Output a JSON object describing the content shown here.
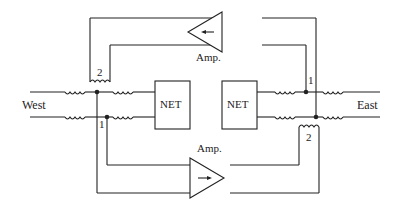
{
  "diagram": {
    "type": "two-wire repeater circuit (hybrid with amplifiers)",
    "labels": {
      "west": "West",
      "east": "East",
      "net_left": "NET",
      "net_right": "NET",
      "amp_top": "Amp.",
      "amp_bottom": "Amp.",
      "coil_top_left": "2",
      "coil_bottom_left": "1",
      "coil_top_right": "1",
      "coil_bottom_right": "2"
    },
    "amplifiers": [
      {
        "name": "top",
        "direction": "west"
      },
      {
        "name": "bottom",
        "direction": "east"
      }
    ],
    "colors": {
      "line": "#222222",
      "background": "#ffffff"
    }
  }
}
